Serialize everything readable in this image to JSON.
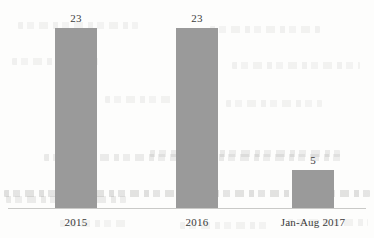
{
  "chart_data": {
    "type": "bar",
    "title": "",
    "subtitle": "",
    "xlabel": "",
    "ylabel": "",
    "categories": [
      "2015",
      "2016",
      "Jan-Aug 2017"
    ],
    "values": [
      23,
      23,
      5
    ],
    "data_labels": [
      "23",
      "23",
      "5"
    ],
    "series": [
      {
        "name": "",
        "values": [
          23,
          23,
          5
        ]
      }
    ],
    "ylim": [
      0,
      23
    ],
    "grid": false,
    "legend": null,
    "legend_position": "none",
    "annotations": [],
    "axis": {
      "baseline_visible": true,
      "y_axis_visible": false,
      "tick_labels_y": []
    },
    "colors": {
      "bar_fill": "#9a9a9a",
      "axis_line": "#c9c9c7",
      "label_text": "#3b3b3b",
      "value_text": "#3c3c3c",
      "background": "#fdfdfc"
    }
  },
  "bars": [
    {
      "category": "2015",
      "value_label": "23"
    },
    {
      "category": "2016",
      "value_label": "23"
    },
    {
      "category": "Jan-Aug 2017",
      "value_label": "5"
    }
  ]
}
